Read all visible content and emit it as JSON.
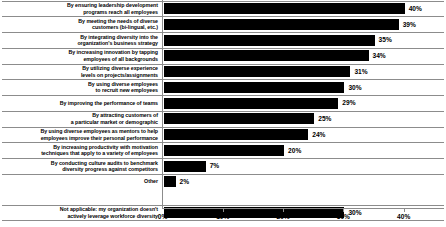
{
  "chart_data": {
    "type": "bar",
    "orientation": "horizontal",
    "title": "",
    "xlabel": "",
    "ylabel": "",
    "xlim": [
      0,
      46.8
    ],
    "xticks": [
      "0%",
      "10%",
      "20%",
      "30%",
      "40%"
    ],
    "xtick_values": [
      0,
      10,
      20,
      30,
      40
    ],
    "grid": true,
    "legend": null,
    "bar_color": "#000000",
    "gridline_color": "#8c8c8c",
    "categories": [
      "By ensuring leadership development programs reach all employees",
      "By meeting the needs of diverse customers (bi-lingual, etc.)",
      "By integrating diversity into the organization's business strategy",
      "By increasing innovation by tapping employees of all backgrounds",
      "By utilizing diverse experience levels on projects/assignments",
      "By using diverse employees to recruit new employees",
      "By improving the performance of teams",
      "By attracting customers of a particular market or demographic",
      "By using diverse employees as mentors to help employees improve their personal performance",
      "By increasing productivity with motivation techniques that apply to a variety of employees",
      "By conducting culture audits to benchmark diversity progress against competitors",
      "Other",
      "Not applicable: my organization doesn't actively leverage workforce diversity"
    ],
    "values": [
      40,
      39,
      35,
      34,
      31,
      30,
      29,
      25,
      24,
      20,
      7,
      2,
      30
    ],
    "value_labels": [
      "40%",
      "39%",
      "35%",
      "34%",
      "31%",
      "30%",
      "29%",
      "25%",
      "24%",
      "20%",
      "7%",
      "2%",
      "30%"
    ]
  },
  "rows": [
    {
      "line1": "By ensuring leadership development",
      "line2": "programs reach all employees",
      "value": 40,
      "value_label": "40%"
    },
    {
      "line1": "By meeting the needs of diverse",
      "line2": "customers (bi-lingual, etc.)",
      "value": 39,
      "value_label": "39%"
    },
    {
      "line1": "By integrating diversity into the",
      "line2": "organization's business strategy",
      "value": 35,
      "value_label": "35%"
    },
    {
      "line1": "By increasing innovation by tapping",
      "line2": "employees of all backgrounds",
      "value": 34,
      "value_label": "34%"
    },
    {
      "line1": "By utilizing diverse experience",
      "line2": "levels on projects/assignments",
      "value": 31,
      "value_label": "31%"
    },
    {
      "line1": "By using diverse employees",
      "line2": "to recruit new employees",
      "value": 30,
      "value_label": "30%"
    },
    {
      "line1": "By improving the performance of teams",
      "line2": "",
      "value": 29,
      "value_label": "29%"
    },
    {
      "line1": "By attracting customers of",
      "line2": "a particular market or demographic",
      "value": 25,
      "value_label": "25%"
    },
    {
      "line1": "By using diverse employees as mentors to help",
      "line2": "employees improve their personal performance",
      "value": 24,
      "value_label": "24%"
    },
    {
      "line1": "By increasing productivity with motivation",
      "line2": "techniques that apply to a variety of employees",
      "value": 20,
      "value_label": "20%"
    },
    {
      "line1": "By conducting culture audits to benchmark",
      "line2": "diversity progress against competitors",
      "value": 7,
      "value_label": "7%"
    },
    {
      "line1": "Other",
      "line2": "",
      "value": 2,
      "value_label": "2%"
    },
    {
      "line1": "Not applicable: my organization doesn't",
      "line2": "actively leverage workforce diversity",
      "value": 30,
      "value_label": "30%"
    }
  ],
  "axis": {
    "ticks": [
      {
        "label": "0%",
        "value": 0
      },
      {
        "label": "10%",
        "value": 10
      },
      {
        "label": "20%",
        "value": 20
      },
      {
        "label": "30%",
        "value": 30
      },
      {
        "label": "40%",
        "value": 40
      }
    ]
  }
}
